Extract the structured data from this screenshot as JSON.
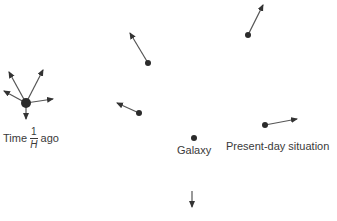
{
  "diagram": {
    "colors": {
      "ink": "#2b2b2b",
      "arrow": "#555555",
      "text": "#3a3a3a",
      "background": "#ffffff"
    },
    "labels": {
      "time_prefix": "Time",
      "time_fraction_numerator": "1",
      "time_fraction_denominator": "H",
      "time_suffix": "ago",
      "galaxy": "Galaxy",
      "present_day": "Present-day situation"
    },
    "past_cluster": {
      "description": "All galaxies together at time 1/H ago, velocity vectors radiating outward",
      "center": [
        26,
        103
      ],
      "dot_radius": 5,
      "arrows": [
        {
          "to": [
            9,
            72
          ]
        },
        {
          "to": [
            43,
            70
          ]
        },
        {
          "to": [
            4,
            91
          ]
        },
        {
          "to": [
            53,
            99
          ]
        },
        {
          "to": [
            26,
            119
          ]
        }
      ]
    },
    "present_galaxies": [
      {
        "name": "galaxy-upper-middle",
        "position": [
          148,
          63
        ],
        "arrow_to": [
          130,
          33
        ]
      },
      {
        "name": "galaxy-middle-left",
        "position": [
          139,
          113
        ],
        "arrow_to": [
          117,
          103
        ]
      },
      {
        "name": "galaxy-upper-right",
        "position": [
          248,
          35
        ],
        "arrow_to": [
          263,
          5
        ]
      },
      {
        "name": "galaxy-right",
        "position": [
          265,
          125
        ],
        "arrow_to": [
          297,
          119
        ]
      },
      {
        "name": "galaxy-reference",
        "position": [
          194,
          138
        ],
        "arrow_to": null
      },
      {
        "name": "galaxy-bottom-offscreen",
        "position": null,
        "arrow_from": [
          192,
          191
        ],
        "arrow_to": [
          192,
          207
        ]
      }
    ]
  }
}
